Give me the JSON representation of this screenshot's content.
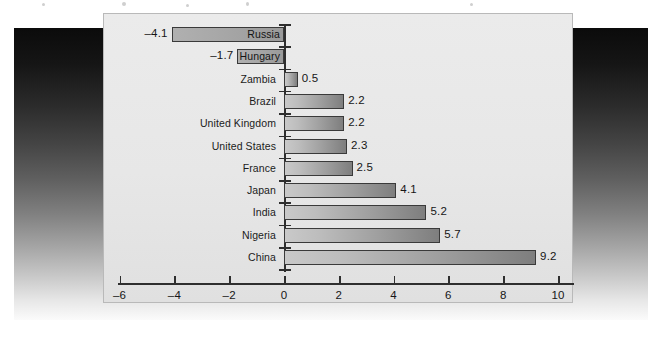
{
  "chart_data": {
    "type": "bar",
    "orientation": "horizontal",
    "title": "",
    "subtitle": "",
    "xlabel": "",
    "ylabel": "",
    "xlim": [
      -6,
      10
    ],
    "xticks": [
      -6,
      -4,
      -2,
      0,
      2,
      4,
      6,
      8,
      10
    ],
    "xtick_labels": [
      "–6",
      "–4",
      "–2",
      "0",
      "2",
      "4",
      "6",
      "8",
      "10"
    ],
    "grid": false,
    "legend": null,
    "categories": [
      "Russia",
      "Hungary",
      "Zambia",
      "Brazil",
      "United Kingdom",
      "United States",
      "France",
      "Japan",
      "India",
      "Nigeria",
      "China"
    ],
    "values": [
      -4.1,
      -1.7,
      0.5,
      2.2,
      2.2,
      2.3,
      2.5,
      4.1,
      5.2,
      5.7,
      9.2
    ],
    "value_labels": [
      "–4.1",
      "–1.7",
      "0.5",
      "2.2",
      "2.2",
      "2.3",
      "2.5",
      "4.1",
      "5.2",
      "5.7",
      "9.2"
    ]
  },
  "colors": {
    "panel_background": "#e7e7e7",
    "panel_border": "#b9b9b9",
    "bar_light": "#c9c9c9",
    "bar_dark": "#7e7e7e",
    "bar_outline": "#3a3a3a",
    "axis": "#2e2e2e",
    "text": "#161616",
    "backdrop_top": "#0b0b0b",
    "backdrop_bottom": "#fbfbfb"
  }
}
